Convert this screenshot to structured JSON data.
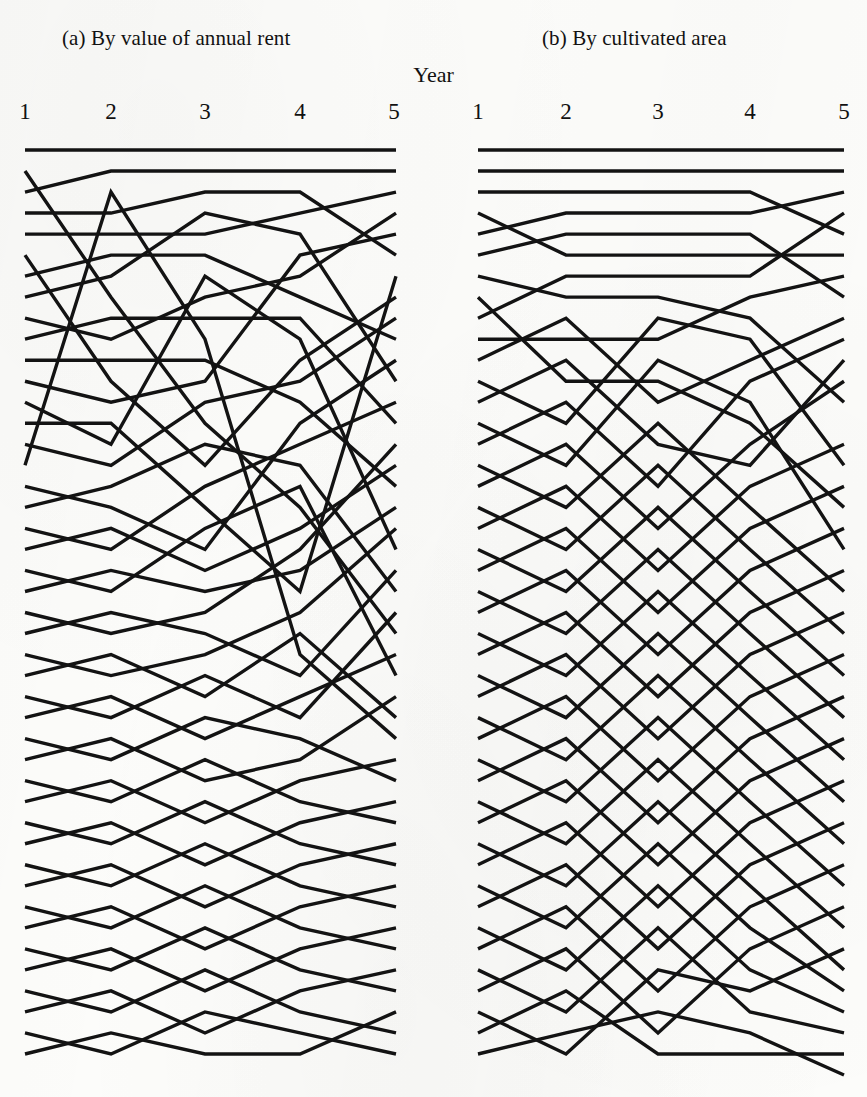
{
  "figure": {
    "axis_title": "Year",
    "tick_labels": [
      "1",
      "2",
      "3",
      "4",
      "5"
    ],
    "line_color": "#131313",
    "background_color": "#fcfcfa"
  },
  "panels": [
    {
      "id": "a",
      "title": "(a) By value of annual rent"
    },
    {
      "id": "b",
      "title": "(b) By cultivated area"
    }
  ],
  "chart_data": {
    "type": "line",
    "title": "",
    "subtitle": "",
    "xlabel": "Year",
    "ylabel": "",
    "grid": false,
    "legend": "none",
    "x": [
      1,
      2,
      3,
      4,
      5
    ],
    "xlim": [
      1,
      5
    ],
    "ylim": [
      1,
      45
    ],
    "y_axis_direction": "inverted",
    "note": "Two parallel-coordinate (rank-trajectory) panels. Each polyline is one household tracked across five years; y is its rank position within the panel's ordering (1 = top of panel).",
    "panels": [
      {
        "id": "a",
        "title": "(a) By value of annual rent",
        "series": [
          {
            "name": "a01",
            "values": [
              1,
              1,
              1,
              1,
              1
            ]
          },
          {
            "name": "a02",
            "values": [
              3,
              2,
              2,
              2,
              2
            ]
          },
          {
            "name": "a03",
            "values": [
              4,
              4,
              3,
              3,
              6
            ]
          },
          {
            "name": "a04",
            "values": [
              5,
              5,
              5,
              4,
              3
            ]
          },
          {
            "name": "a05",
            "values": [
              2,
              8,
              14,
              18,
              24
            ]
          },
          {
            "name": "a06",
            "values": [
              7,
              6,
              6,
              8,
              10
            ]
          },
          {
            "name": "a07",
            "values": [
              8,
              7,
              4,
              5,
              12
            ]
          },
          {
            "name": "a08",
            "values": [
              9,
              10,
              8,
              7,
              4
            ]
          },
          {
            "name": "a09",
            "values": [
              10,
              9,
              9,
              9,
              14
            ]
          },
          {
            "name": "a10",
            "values": [
              6,
              12,
              16,
              11,
              8
            ]
          },
          {
            "name": "a11",
            "values": [
              11,
              11,
              11,
              13,
              17
            ]
          },
          {
            "name": "a12",
            "values": [
              12,
              13,
              12,
              6,
              5
            ]
          },
          {
            "name": "a13",
            "values": [
              13,
              15,
              7,
              10,
              20
            ]
          },
          {
            "name": "a14",
            "values": [
              14,
              14,
              18,
              22,
              7
            ]
          },
          {
            "name": "a15",
            "values": [
              15,
              16,
              13,
              12,
              9
            ]
          },
          {
            "name": "a16",
            "values": [
              16,
              3,
              10,
              25,
              29
            ]
          },
          {
            "name": "a17",
            "values": [
              17,
              18,
              20,
              14,
              11
            ]
          },
          {
            "name": "a18",
            "values": [
              18,
              17,
              15,
              16,
              22
            ]
          },
          {
            "name": "a19",
            "values": [
              19,
              20,
              17,
              15,
              13
            ]
          },
          {
            "name": "a20",
            "values": [
              20,
              19,
              21,
              19,
              16
            ]
          },
          {
            "name": "a21",
            "values": [
              21,
              22,
              19,
              17,
              26
            ]
          },
          {
            "name": "a22",
            "values": [
              22,
              21,
              22,
              21,
              18
            ]
          },
          {
            "name": "a23",
            "values": [
              23,
              24,
              23,
              20,
              15
            ]
          },
          {
            "name": "a24",
            "values": [
              24,
              23,
              24,
              26,
              21
            ]
          },
          {
            "name": "a25",
            "values": [
              25,
              26,
              25,
              23,
              19
            ]
          },
          {
            "name": "a26",
            "values": [
              26,
              25,
              27,
              24,
              28
            ]
          },
          {
            "name": "a27",
            "values": [
              27,
              28,
              26,
              28,
              23
            ]
          },
          {
            "name": "a28",
            "values": [
              28,
              27,
              29,
              27,
              25
            ]
          },
          {
            "name": "a29",
            "values": [
              29,
              30,
              28,
              29,
              31
            ]
          },
          {
            "name": "a30",
            "values": [
              30,
              29,
              31,
              30,
              27
            ]
          },
          {
            "name": "a31",
            "values": [
              31,
              32,
              30,
              32,
              33
            ]
          },
          {
            "name": "a32",
            "values": [
              32,
              31,
              33,
              31,
              30
            ]
          },
          {
            "name": "a33",
            "values": [
              33,
              34,
              32,
              34,
              35
            ]
          },
          {
            "name": "a34",
            "values": [
              34,
              33,
              35,
              33,
              32
            ]
          },
          {
            "name": "a35",
            "values": [
              35,
              36,
              34,
              36,
              37
            ]
          },
          {
            "name": "a36",
            "values": [
              36,
              35,
              37,
              35,
              34
            ]
          },
          {
            "name": "a37",
            "values": [
              37,
              38,
              36,
              38,
              39
            ]
          },
          {
            "name": "a38",
            "values": [
              38,
              37,
              39,
              37,
              36
            ]
          },
          {
            "name": "a39",
            "values": [
              39,
              40,
              38,
              40,
              41
            ]
          },
          {
            "name": "a40",
            "values": [
              40,
              39,
              41,
              39,
              38
            ]
          },
          {
            "name": "a41",
            "values": [
              41,
              42,
              40,
              42,
              43
            ]
          },
          {
            "name": "a42",
            "values": [
              42,
              41,
              43,
              41,
              40
            ]
          },
          {
            "name": "a43",
            "values": [
              43,
              44,
              42,
              43,
              44
            ]
          },
          {
            "name": "a44",
            "values": [
              44,
              43,
              44,
              44,
              42
            ]
          }
        ]
      },
      {
        "id": "b",
        "title": "(b) By cultivated area",
        "series": [
          {
            "name": "b01",
            "values": [
              1,
              1,
              1,
              1,
              1
            ]
          },
          {
            "name": "b02",
            "values": [
              2,
              2,
              2,
              2,
              2
            ]
          },
          {
            "name": "b03",
            "values": [
              3,
              3,
              3,
              3,
              5
            ]
          },
          {
            "name": "b04",
            "values": [
              5,
              4,
              4,
              4,
              3
            ]
          },
          {
            "name": "b05",
            "values": [
              4,
              6,
              6,
              6,
              6
            ]
          },
          {
            "name": "b06",
            "values": [
              6,
              5,
              5,
              5,
              8
            ]
          },
          {
            "name": "b07",
            "values": [
              7,
              8,
              8,
              9,
              13
            ]
          },
          {
            "name": "b08",
            "values": [
              9,
              7,
              7,
              7,
              4
            ]
          },
          {
            "name": "b09",
            "values": [
              10,
              10,
              10,
              8,
              7
            ]
          },
          {
            "name": "b10",
            "values": [
              8,
              12,
              12,
              14,
              18
            ]
          },
          {
            "name": "b11",
            "values": [
              11,
              9,
              13,
              11,
              9
            ]
          },
          {
            "name": "b12",
            "values": [
              12,
              14,
              9,
              10,
              16
            ]
          },
          {
            "name": "b13",
            "values": [
              13,
              11,
              15,
              16,
              11
            ]
          },
          {
            "name": "b14",
            "values": [
              14,
              16,
              11,
              13,
              20
            ]
          },
          {
            "name": "b15",
            "values": [
              15,
              13,
              17,
              12,
              10
            ]
          },
          {
            "name": "b16",
            "values": [
              16,
              18,
              14,
              18,
              22
            ]
          },
          {
            "name": "b17",
            "values": [
              17,
              15,
              19,
              15,
              12
            ]
          },
          {
            "name": "b18",
            "values": [
              18,
              20,
              16,
              20,
              24
            ]
          },
          {
            "name": "b19",
            "values": [
              19,
              17,
              21,
              17,
              15
            ]
          },
          {
            "name": "b20",
            "values": [
              20,
              22,
              18,
              22,
              26
            ]
          },
          {
            "name": "b21",
            "values": [
              21,
              19,
              23,
              19,
              17
            ]
          },
          {
            "name": "b22",
            "values": [
              22,
              24,
              20,
              24,
              28
            ]
          },
          {
            "name": "b23",
            "values": [
              23,
              21,
              25,
              21,
              19
            ]
          },
          {
            "name": "b24",
            "values": [
              24,
              26,
              22,
              26,
              30
            ]
          },
          {
            "name": "b25",
            "values": [
              25,
              23,
              27,
              23,
              21
            ]
          },
          {
            "name": "b26",
            "values": [
              26,
              28,
              24,
              28,
              32
            ]
          },
          {
            "name": "b27",
            "values": [
              27,
              25,
              29,
              25,
              23
            ]
          },
          {
            "name": "b28",
            "values": [
              28,
              30,
              26,
              30,
              34
            ]
          },
          {
            "name": "b29",
            "values": [
              29,
              27,
              31,
              27,
              25
            ]
          },
          {
            "name": "b30",
            "values": [
              30,
              32,
              28,
              32,
              36
            ]
          },
          {
            "name": "b31",
            "values": [
              31,
              29,
              33,
              29,
              27
            ]
          },
          {
            "name": "b32",
            "values": [
              32,
              34,
              30,
              34,
              38
            ]
          },
          {
            "name": "b33",
            "values": [
              33,
              31,
              35,
              31,
              29
            ]
          },
          {
            "name": "b34",
            "values": [
              34,
              36,
              32,
              36,
              40
            ]
          },
          {
            "name": "b35",
            "values": [
              35,
              33,
              37,
              33,
              31
            ]
          },
          {
            "name": "b36",
            "values": [
              36,
              38,
              34,
              38,
              41
            ]
          },
          {
            "name": "b37",
            "values": [
              37,
              35,
              39,
              35,
              33
            ]
          },
          {
            "name": "b38",
            "values": [
              38,
              40,
              36,
              40,
              42
            ]
          },
          {
            "name": "b39",
            "values": [
              39,
              37,
              41,
              37,
              35
            ]
          },
          {
            "name": "b40",
            "values": [
              40,
              42,
              38,
              42,
              43
            ]
          },
          {
            "name": "b41",
            "values": [
              41,
              39,
              43,
              39,
              37
            ]
          },
          {
            "name": "b42",
            "values": [
              42,
              44,
              40,
              41,
              39
            ]
          },
          {
            "name": "b43",
            "values": [
              43,
              41,
              44,
              44,
              44
            ]
          },
          {
            "name": "b44",
            "values": [
              44,
              43,
              42,
              43,
              45
            ]
          }
        ]
      }
    ]
  }
}
